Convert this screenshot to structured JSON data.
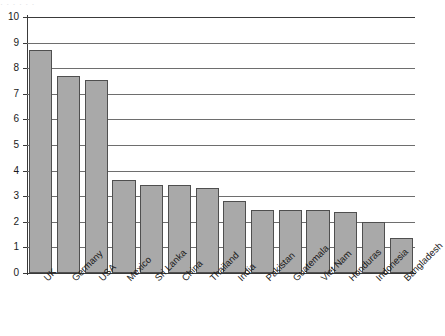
{
  "figure": {
    "top_crop_artifact": "· · · · · ·"
  },
  "chart_data": {
    "type": "bar",
    "title": "",
    "subtitle": "",
    "xlabel": "",
    "ylabel": "",
    "categories": [
      "UK",
      "Germany",
      "USA",
      "Mexico",
      "Sri Lanka",
      "China",
      "Thailand",
      "India",
      "Pakistan",
      "Guatemala",
      "Viet Nam",
      "Honduras",
      "Indonesia",
      "Bangladesh"
    ],
    "values": [
      8.7,
      7.7,
      7.55,
      3.62,
      3.43,
      3.43,
      3.33,
      2.82,
      2.46,
      2.46,
      2.46,
      2.39,
      2.0,
      1.35
    ],
    "ylim": [
      0,
      10
    ],
    "yticks": [
      0,
      1,
      2,
      3,
      4,
      5,
      6,
      7,
      8,
      9,
      10
    ],
    "ytick_labels": [
      "0",
      "1",
      "2",
      "3",
      "4",
      "5",
      "6",
      "7",
      "8",
      "9",
      "10"
    ],
    "grid": true,
    "grid_axis": "y",
    "legend": false,
    "legend_position": "none",
    "bar_color": "#a9a9a9",
    "bar_edge_color": "#4f4f4f",
    "axis_color": "#3a3a3a",
    "gridline_color": "#6e6e6e",
    "category_label_rotation": -45
  }
}
